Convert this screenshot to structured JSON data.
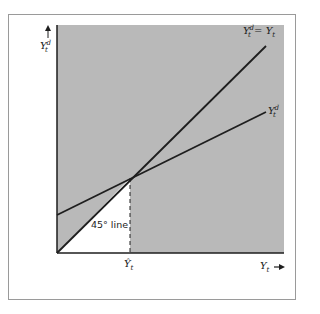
{
  "diagram": {
    "colors": {
      "background": "#ffffff",
      "shaded_region": "#b9b9b9",
      "lines": "#1e1e1e",
      "frame": "#9a9a9a"
    },
    "axes": {
      "y_label_main": "Y",
      "y_label_sup": "d",
      "y_label_sub": "t",
      "x_label_main": "Y",
      "x_label_sub": "t",
      "x_arrow": "→",
      "y_arrow": "↑"
    },
    "lines": [
      {
        "name": "45-degree line",
        "label_main": "Y",
        "label_sup": "d",
        "label_sub": "t",
        "label_eq": " = Y",
        "label_eq_sub": "t"
      },
      {
        "name": "aggregate demand",
        "label_main": "Y",
        "label_sup": "d",
        "label_sub": "t"
      }
    ],
    "annotation": "45° line",
    "equilibrium": {
      "label_main": "Ŷ",
      "label_sub": "t"
    }
  }
}
